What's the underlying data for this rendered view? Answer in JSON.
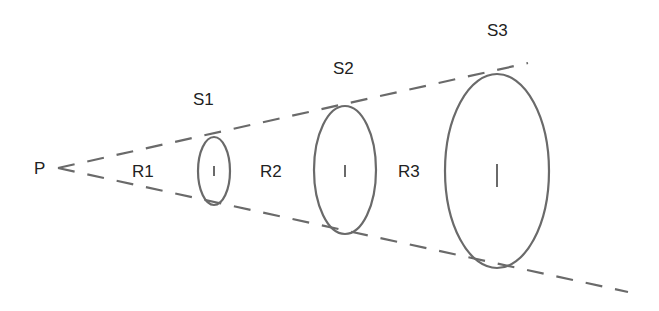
{
  "diagram": {
    "type": "light-cone / inverse-square spreading",
    "colors": {
      "stroke": "#6a6a6a",
      "text": "#222222",
      "background": "#ffffff"
    },
    "point": {
      "label": "P",
      "x": 55,
      "y": 168
    },
    "rays": {
      "upper_end": {
        "x": 528,
        "y": 63
      },
      "lower_end": {
        "x": 628,
        "y": 292
      },
      "style": "dashed"
    },
    "surfaces": [
      {
        "label": "S1",
        "cx": 214,
        "cy": 171,
        "rx": 16,
        "ry": 34,
        "label_x": 205,
        "label_y": 105
      },
      {
        "label": "S2",
        "cx": 345,
        "cy": 170,
        "rx": 31,
        "ry": 64,
        "label_x": 338,
        "label_y": 73
      },
      {
        "label": "S3",
        "cx": 497,
        "cy": 171,
        "rx": 52,
        "ry": 97,
        "label_x": 509,
        "label_y": 37
      }
    ],
    "regions": [
      {
        "label": "R1",
        "x": 132,
        "y": 177
      },
      {
        "label": "R2",
        "x": 260,
        "y": 177
      },
      {
        "label": "R3",
        "x": 398,
        "y": 177
      }
    ]
  }
}
